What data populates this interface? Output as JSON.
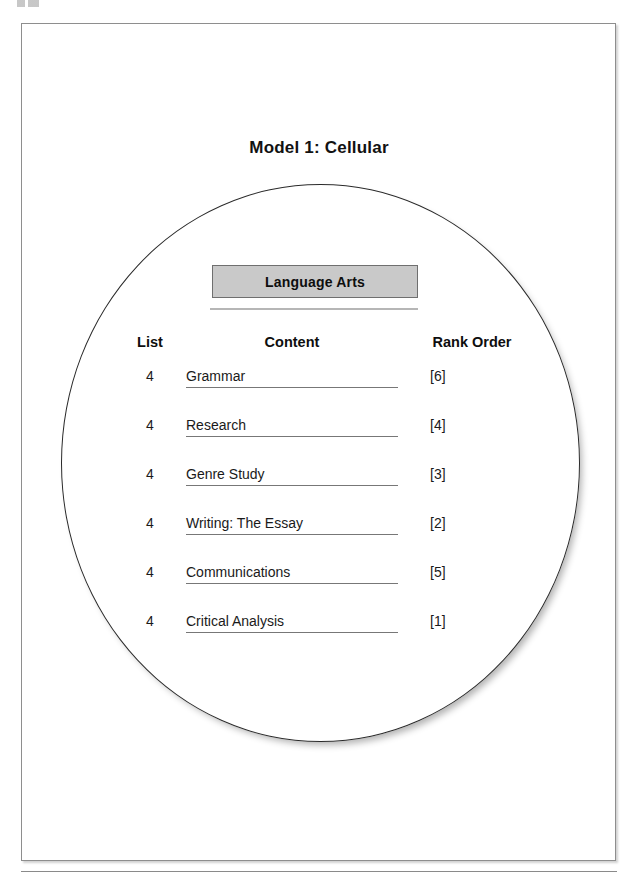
{
  "document": {
    "title": "Model 1: Cellular",
    "page_artifact": "",
    "subject_label": "Language Arts"
  },
  "table": {
    "headers": {
      "list": "List",
      "content": "Content",
      "rank_order": "Rank Order"
    },
    "rows": [
      {
        "list": "4",
        "content": "Grammar",
        "rank": "[6]"
      },
      {
        "list": "4",
        "content": "Research",
        "rank": "[4]"
      },
      {
        "list": "4",
        "content": "Genre Study",
        "rank": "[3]"
      },
      {
        "list": "4",
        "content": "Writing: The Essay",
        "rank": "[2]"
      },
      {
        "list": "4",
        "content": "Communications",
        "rank": "[5]"
      },
      {
        "list": "4",
        "content": "Critical Analysis",
        "rank": "[1]"
      }
    ]
  },
  "colors": {
    "subject_box_fill": "#c9c9c9",
    "subject_box_border": "#6f6f6f",
    "circle_stroke": "#2a2a2a",
    "page_border": "#8e8e8e",
    "text": "#1a1a1a"
  }
}
